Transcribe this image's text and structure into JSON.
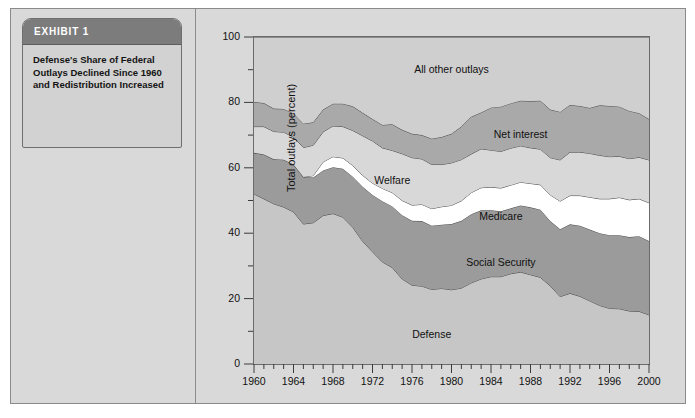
{
  "exhibit": {
    "header_label": "EXHIBIT 1",
    "caption": "Defense's Share of Federal Outlays Declined Since 1960 and Redistribution Increased"
  },
  "chart_data": {
    "type": "area",
    "stacked": true,
    "title": "",
    "xlabel": "",
    "ylabel": "Total outlays (percent)",
    "xlim": [
      1960,
      2000
    ],
    "ylim": [
      0,
      100
    ],
    "grid": false,
    "legend_position": "inline-annotations",
    "x_tick_labels": [
      "1960",
      "1964",
      "1968",
      "1972",
      "1976",
      "1980",
      "1984",
      "1988",
      "1992",
      "1996",
      "2000"
    ],
    "x_tick_values": [
      1960,
      1964,
      1968,
      1972,
      1976,
      1980,
      1984,
      1988,
      1992,
      1996,
      2000
    ],
    "x_minor_tick_step": 1,
    "y_tick_labels": [
      "0",
      "20",
      "40",
      "60",
      "80",
      "100"
    ],
    "y_tick_values": [
      0,
      20,
      40,
      60,
      80,
      100
    ],
    "y_minor_tick_step": 10,
    "x": [
      1960,
      1961,
      1962,
      1963,
      1964,
      1965,
      1966,
      1967,
      1968,
      1969,
      1970,
      1971,
      1972,
      1973,
      1974,
      1975,
      1976,
      1977,
      1978,
      1979,
      1980,
      1981,
      1982,
      1983,
      1984,
      1985,
      1986,
      1987,
      1988,
      1989,
      1990,
      1991,
      1992,
      1993,
      1994,
      1995,
      1996,
      1997,
      1998,
      1999,
      2000
    ],
    "series": [
      {
        "name": "Defense",
        "color": "#c6c6c6",
        "label_x": 1978,
        "label_y": 9,
        "values": [
          52.0,
          50.5,
          49.0,
          48.0,
          46.5,
          42.8,
          43.2,
          45.4,
          46.0,
          44.9,
          41.8,
          37.5,
          34.3,
          31.2,
          29.5,
          26.0,
          24.1,
          23.8,
          22.8,
          23.1,
          22.7,
          23.2,
          24.8,
          26.0,
          26.7,
          26.7,
          27.6,
          28.1,
          27.3,
          26.5,
          23.9,
          20.6,
          21.6,
          20.7,
          19.3,
          17.9,
          17.0,
          16.9,
          16.2,
          16.1,
          15.0
        ]
      },
      {
        "name": "Social Security",
        "color": "#9b9b9b",
        "label_x": 1985,
        "label_y": 31,
        "values": [
          12.6,
          13.6,
          13.6,
          14.5,
          14.5,
          14.4,
          13.8,
          13.8,
          14.2,
          14.8,
          15.5,
          16.7,
          17.4,
          18.6,
          18.7,
          19.5,
          19.7,
          19.9,
          19.5,
          19.5,
          20.1,
          20.6,
          21.0,
          21.0,
          20.3,
          20.0,
          20.0,
          20.4,
          20.6,
          20.7,
          19.8,
          20.6,
          21.1,
          21.6,
          21.8,
          22.1,
          22.4,
          22.5,
          22.6,
          23.0,
          22.6
        ]
      },
      {
        "name": "Medicare",
        "color": "#ffffff",
        "label_x": 1985,
        "label_y": 45,
        "values": [
          0.0,
          0.0,
          0.0,
          0.0,
          0.0,
          0.0,
          0.6,
          2.6,
          3.2,
          3.3,
          3.4,
          3.5,
          3.6,
          3.9,
          4.2,
          4.5,
          4.8,
          5.1,
          5.2,
          5.5,
          5.7,
          6.1,
          6.6,
          6.9,
          7.1,
          7.1,
          7.1,
          7.1,
          7.3,
          7.6,
          8.0,
          8.6,
          8.8,
          9.2,
          9.9,
          10.5,
          11.1,
          11.5,
          11.4,
          11.4,
          11.7
        ]
      },
      {
        "name": "Welfare",
        "color": "#d8d8d8",
        "label_x": 1974,
        "label_y": 56,
        "values": [
          8.0,
          8.5,
          8.5,
          8.4,
          8.4,
          9.0,
          9.3,
          9.2,
          9.4,
          9.6,
          10.7,
          12.1,
          12.9,
          12.4,
          12.9,
          14.3,
          14.5,
          13.9,
          13.5,
          12.9,
          13.0,
          12.6,
          11.8,
          11.9,
          11.3,
          11.2,
          11.3,
          11.1,
          10.9,
          10.9,
          11.4,
          12.6,
          13.3,
          13.3,
          13.4,
          13.3,
          12.9,
          12.6,
          12.6,
          12.7,
          13.1
        ]
      },
      {
        "name": "Net interest",
        "color": "#a9a9a9",
        "label_x": 1987,
        "label_y": 70,
        "values": [
          7.5,
          7.2,
          7.0,
          7.1,
          7.2,
          7.3,
          7.0,
          6.8,
          6.8,
          7.0,
          7.4,
          7.0,
          6.7,
          7.0,
          8.0,
          7.3,
          7.3,
          7.3,
          7.9,
          8.4,
          8.9,
          10.1,
          11.4,
          11.1,
          13.0,
          13.7,
          13.7,
          13.8,
          14.3,
          14.8,
          14.7,
          14.7,
          14.4,
          14.1,
          13.9,
          15.3,
          15.5,
          15.2,
          14.6,
          13.5,
          12.5
        ]
      },
      {
        "name": "All other outlays",
        "color": "#cfcfcf",
        "label_x": 1980,
        "label_y": 90,
        "values": [
          19.9,
          20.2,
          21.9,
          22.0,
          23.4,
          26.5,
          26.1,
          22.2,
          20.4,
          20.4,
          21.2,
          23.2,
          25.1,
          26.9,
          26.7,
          28.4,
          29.6,
          30.0,
          31.1,
          30.6,
          29.6,
          27.4,
          24.4,
          23.1,
          21.6,
          21.3,
          20.3,
          19.5,
          19.6,
          19.5,
          22.2,
          22.9,
          20.8,
          21.1,
          21.7,
          20.9,
          21.1,
          21.3,
          22.6,
          23.3,
          25.1
        ]
      }
    ]
  }
}
